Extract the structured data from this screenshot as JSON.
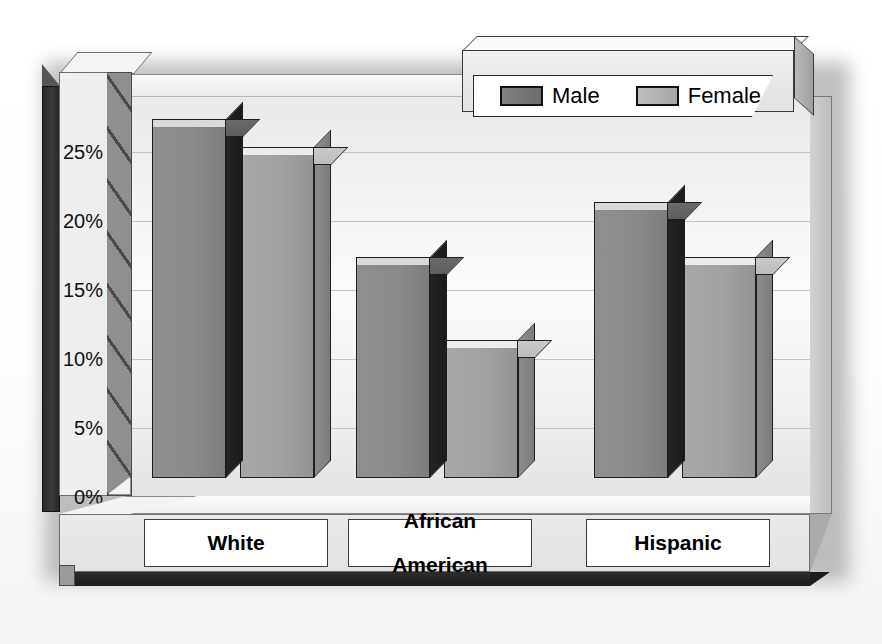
{
  "title": "",
  "legend": {
    "position": "top-right",
    "items": [
      {
        "label": "Male",
        "swatch": "dark-gray",
        "color": "#7a7a7a"
      },
      {
        "label": "Female",
        "swatch": "light-gray",
        "color": "#b0b0b0"
      }
    ]
  },
  "axis": {
    "y_ticks": [
      "25%",
      "20%",
      "15%",
      "10%",
      "5%",
      "0%"
    ],
    "y_min": 0,
    "y_max": 25
  },
  "categories": [
    {
      "label": "White"
    },
    {
      "label": "African\nAmerican"
    },
    {
      "label": "Hispanic"
    }
  ],
  "chart_data": {
    "type": "bar",
    "title": "",
    "xlabel": "",
    "ylabel": "",
    "ylim": [
      0,
      25
    ],
    "ytick_labels": [
      "0%",
      "5%",
      "10%",
      "15%",
      "20%",
      "25%"
    ],
    "ytick_values": [
      0,
      5,
      10,
      15,
      20,
      25
    ],
    "grid": true,
    "legend_position": "top-right",
    "style": "3d-clustered-column-grayscale",
    "units": "percent",
    "categories": [
      "White",
      "African American",
      "Hispanic"
    ],
    "series": [
      {
        "name": "Male",
        "values": [
          26,
          16,
          20
        ]
      },
      {
        "name": "Female",
        "values": [
          24,
          10,
          16
        ]
      }
    ]
  },
  "colors": {
    "male_front": "#8a8a8a",
    "male_side": "#1e1e1e",
    "female_front": "#a2a2a2",
    "female_side": "#828282",
    "plot_bg": "#f4f4f4",
    "gridline": "#c3c3c3",
    "outline": "#1e1e1e"
  }
}
